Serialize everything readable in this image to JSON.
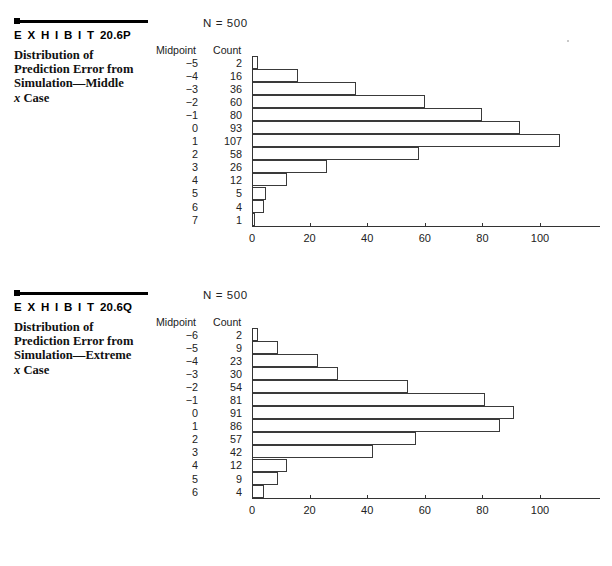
{
  "page": {
    "background": "#ffffff",
    "ink": "#111111"
  },
  "exhibits": [
    {
      "id": "exhibit-20-6P",
      "label_prefix": "E X H I B I T",
      "label_number": "20.6P",
      "caption_line1": "Distribution of",
      "caption_line2": "Prediction Error from",
      "caption_line3": "Simulation—Middle",
      "caption_line4_italic": "x",
      "caption_line4_rest": " Case",
      "n_label": "N  =  500",
      "table": {
        "header_midpoint": "Midpoint",
        "header_count": "Count",
        "rows": [
          {
            "midpoint": "−5",
            "count": "2"
          },
          {
            "midpoint": "−4",
            "count": "16"
          },
          {
            "midpoint": "−3",
            "count": "36"
          },
          {
            "midpoint": "−2",
            "count": "60"
          },
          {
            "midpoint": "−1",
            "count": "80"
          },
          {
            "midpoint": "0",
            "count": "93"
          },
          {
            "midpoint": "1",
            "count": "107"
          },
          {
            "midpoint": "2",
            "count": "58"
          },
          {
            "midpoint": "3",
            "count": "26"
          },
          {
            "midpoint": "4",
            "count": "12"
          },
          {
            "midpoint": "5",
            "count": "5"
          },
          {
            "midpoint": "6",
            "count": "4"
          },
          {
            "midpoint": "7",
            "count": "1"
          }
        ]
      },
      "chart_data": {
        "type": "bar",
        "orientation": "horizontal",
        "title": "Distribution of Prediction Error from Simulation—Middle x Case",
        "xlabel": "",
        "ylabel": "Midpoint",
        "categories": [
          "-5",
          "-4",
          "-3",
          "-2",
          "-1",
          "0",
          "1",
          "2",
          "3",
          "4",
          "5",
          "6",
          "7"
        ],
        "values": [
          2,
          16,
          36,
          60,
          80,
          93,
          107,
          58,
          26,
          12,
          5,
          4,
          1
        ],
        "xlim": [
          0,
          120
        ],
        "xticks": [
          0,
          20,
          40,
          60,
          80,
          100
        ],
        "xticklabels": [
          "0",
          "20",
          "40",
          "60",
          "80",
          "100"
        ],
        "grid": false,
        "legend": false,
        "n": 500
      }
    },
    {
      "id": "exhibit-20-6Q",
      "label_prefix": "E X H I B I T",
      "label_number": "20.6Q",
      "caption_line1": "Distribution of",
      "caption_line2": "Prediction Error from",
      "caption_line3": "Simulation—Extreme",
      "caption_line4_italic": "x",
      "caption_line4_rest": " Case",
      "n_label": "N  =  500",
      "table": {
        "header_midpoint": "Midpoint",
        "header_count": "Count",
        "rows": [
          {
            "midpoint": "−6",
            "count": "2"
          },
          {
            "midpoint": "−5",
            "count": "9"
          },
          {
            "midpoint": "−4",
            "count": "23"
          },
          {
            "midpoint": "−3",
            "count": "30"
          },
          {
            "midpoint": "−2",
            "count": "54"
          },
          {
            "midpoint": "−1",
            "count": "81"
          },
          {
            "midpoint": "0",
            "count": "91"
          },
          {
            "midpoint": "1",
            "count": "86"
          },
          {
            "midpoint": "2",
            "count": "57"
          },
          {
            "midpoint": "3",
            "count": "42"
          },
          {
            "midpoint": "4",
            "count": "12"
          },
          {
            "midpoint": "5",
            "count": "9"
          },
          {
            "midpoint": "6",
            "count": "4"
          }
        ]
      },
      "chart_data": {
        "type": "bar",
        "orientation": "horizontal",
        "title": "Distribution of Prediction Error from Simulation—Extreme x Case",
        "xlabel": "",
        "ylabel": "Midpoint",
        "categories": [
          "-6",
          "-5",
          "-4",
          "-3",
          "-2",
          "-1",
          "0",
          "1",
          "2",
          "3",
          "4",
          "5",
          "6"
        ],
        "values": [
          2,
          9,
          23,
          30,
          54,
          81,
          91,
          86,
          57,
          42,
          12,
          9,
          4
        ],
        "xlim": [
          0,
          120
        ],
        "xticks": [
          0,
          20,
          40,
          60,
          80,
          100
        ],
        "xticklabels": [
          "0",
          "20",
          "40",
          "60",
          "80",
          "100"
        ],
        "grid": false,
        "legend": false,
        "n": 500
      }
    }
  ],
  "scale": {
    "px_per_unit": 2.88,
    "bar_row_height": 13.05
  }
}
